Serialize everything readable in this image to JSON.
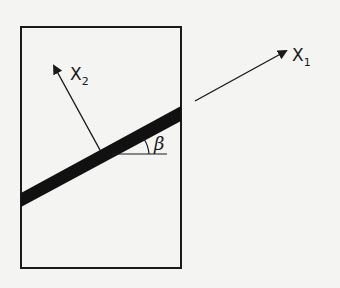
{
  "diagram": {
    "axes": {
      "x1": {
        "label": "X",
        "subscript": "1"
      },
      "x2": {
        "label": "X",
        "subscript": "2"
      }
    },
    "angle_label": "β",
    "colors": {
      "stroke": "#1a1a1a",
      "band": "#111111",
      "background": "#f4f4f2"
    }
  }
}
